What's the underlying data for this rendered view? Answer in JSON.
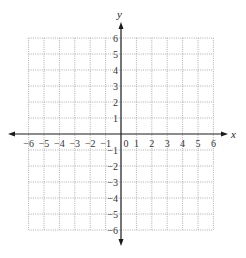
{
  "graph": {
    "x_axis_label": "x",
    "y_axis_label": "y",
    "x_range": [
      -6,
      6
    ],
    "y_range": [
      -6,
      6
    ],
    "x_ticks": [
      "−6",
      "−5",
      "−4",
      "−3",
      "−2",
      "−1",
      "0",
      "1",
      "2",
      "3",
      "4",
      "5",
      "6"
    ],
    "y_ticks_positive": [
      "1",
      "2",
      "3",
      "4",
      "5",
      "6"
    ],
    "y_ticks_negative": [
      "−1",
      "−2",
      "−3",
      "−4",
      "−5",
      "−6"
    ],
    "grid_style": "dotted",
    "colors": {
      "axis": "#1a1a1a",
      "grid": "#9a9a9a",
      "text": "#333333"
    }
  }
}
